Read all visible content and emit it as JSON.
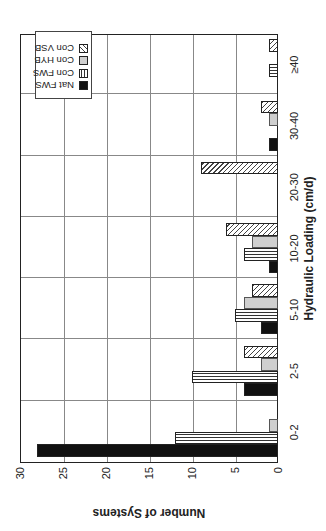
{
  "chart_data": {
    "type": "bar",
    "orientation": "vertical bars, figure rotated 90 degrees counterclockwise on page",
    "title": "",
    "xlabel": "Hydraulic Loading (cm/d)",
    "ylabel": "Number of Systems",
    "categories": [
      "0-2",
      "2-5",
      "5-10",
      "10-20",
      "20-30",
      "30-40",
      "≥40"
    ],
    "series": [
      {
        "name": "Nat FWS",
        "pattern": "solid-black",
        "values": [
          28,
          4,
          2,
          1,
          0,
          1,
          0
        ]
      },
      {
        "name": "Con FWS",
        "pattern": "vertical-lines",
        "values": [
          12,
          10,
          5,
          4,
          0,
          0,
          1
        ]
      },
      {
        "name": "Con HYB",
        "pattern": "light-gray",
        "values": [
          1,
          2,
          4,
          3,
          0,
          1,
          0
        ]
      },
      {
        "name": "Con VSB",
        "pattern": "diagonal-hatch",
        "values": [
          0,
          4,
          3,
          6,
          9,
          2,
          1
        ]
      }
    ],
    "ylim": [
      0,
      30
    ],
    "yticks": [
      0,
      5,
      10,
      15,
      20,
      25,
      30
    ],
    "grid": true,
    "legend_position": "upper right (of unrotated chart)"
  },
  "axes": {
    "xlabel": "Hydraulic Loading (cm/d)",
    "ylabel": "Number of Systems",
    "yticks": [
      "0",
      "5",
      "10",
      "15",
      "20",
      "25",
      "30"
    ],
    "xticks": [
      "0-2",
      "2-5",
      "5-10",
      "10-20",
      "20-30",
      "30-40",
      "≥40"
    ]
  },
  "legend": {
    "items": [
      {
        "label": "Nat FWS",
        "swatch": "s0"
      },
      {
        "label": "Con FWS",
        "swatch": "s1"
      },
      {
        "label": "Con HYB",
        "swatch": "s2"
      },
      {
        "label": "Con VSB",
        "swatch": "s3"
      }
    ]
  }
}
